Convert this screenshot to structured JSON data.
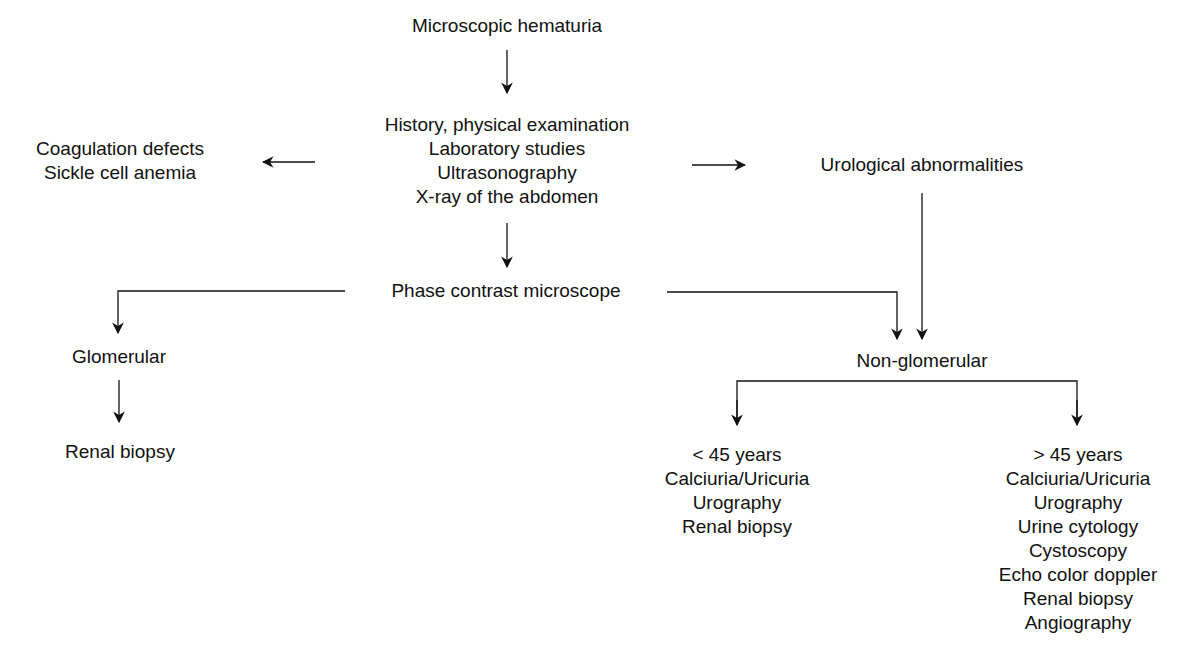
{
  "diagram": {
    "type": "flowchart",
    "nodes": {
      "start": {
        "lines": [
          "Microscopic hematuria"
        ]
      },
      "workup": {
        "lines": [
          "History, physical examination",
          "Laboratory studies",
          "Ultrasonography",
          "X-ray of the abdomen"
        ]
      },
      "coag": {
        "lines": [
          "Coagulation defects",
          "Sickle cell anemia"
        ]
      },
      "uro": {
        "lines": [
          "Urological abnormalities"
        ]
      },
      "phase": {
        "lines": [
          "Phase contrast microscope"
        ]
      },
      "glom": {
        "lines": [
          "Glomerular"
        ]
      },
      "glom_biopsy": {
        "lines": [
          "Renal biopsy"
        ]
      },
      "nonglom": {
        "lines": [
          "Non-glomerular"
        ]
      },
      "under45": {
        "lines": [
          "< 45 years",
          "Calciuria/Uricuria",
          "Urography",
          "Renal biopsy"
        ]
      },
      "over45": {
        "lines": [
          "> 45 years",
          "Calciuria/Uricuria",
          "Urography",
          "Urine cytology",
          "Cystoscopy",
          "Echo color doppler",
          "Renal biopsy",
          "Angiography"
        ]
      }
    },
    "edges": [
      {
        "from": "start",
        "to": "workup"
      },
      {
        "from": "workup",
        "to": "coag"
      },
      {
        "from": "workup",
        "to": "uro"
      },
      {
        "from": "workup",
        "to": "phase"
      },
      {
        "from": "phase",
        "to": "glom"
      },
      {
        "from": "phase",
        "to": "nonglom"
      },
      {
        "from": "uro",
        "to": "nonglom"
      },
      {
        "from": "glom",
        "to": "glom_biopsy"
      },
      {
        "from": "nonglom",
        "to": "under45"
      },
      {
        "from": "nonglom",
        "to": "over45"
      }
    ],
    "line_color": "#111111"
  }
}
